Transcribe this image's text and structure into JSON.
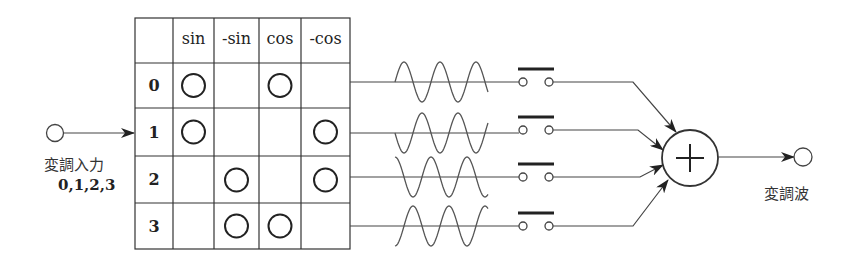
{
  "input": {
    "label": "変調入力",
    "values_label": "0,1,2,3"
  },
  "output": {
    "label": "変調波"
  },
  "table": {
    "columns": [
      "sin",
      "-sin",
      "cos",
      "-cos"
    ],
    "rows": [
      {
        "label": "0",
        "marks": [
          true,
          false,
          true,
          false
        ]
      },
      {
        "label": "1",
        "marks": [
          true,
          false,
          false,
          true
        ]
      },
      {
        "label": "2",
        "marks": [
          false,
          true,
          false,
          true
        ]
      },
      {
        "label": "3",
        "marks": [
          false,
          true,
          true,
          false
        ]
      }
    ],
    "mark_symbol": "○"
  },
  "carriers": [
    {
      "row": "0",
      "shape": "sin"
    },
    {
      "row": "1",
      "shape": "-sin"
    },
    {
      "row": "2",
      "shape": "cos"
    },
    {
      "row": "3",
      "shape": "-cos"
    }
  ],
  "summer": {
    "symbol": "+"
  },
  "switches": [
    {
      "row": "0",
      "state": "open"
    },
    {
      "row": "1",
      "state": "open"
    },
    {
      "row": "2",
      "state": "open"
    },
    {
      "row": "3",
      "state": "open"
    }
  ],
  "colors": {
    "ink": "#222222",
    "background": "#ffffff"
  }
}
